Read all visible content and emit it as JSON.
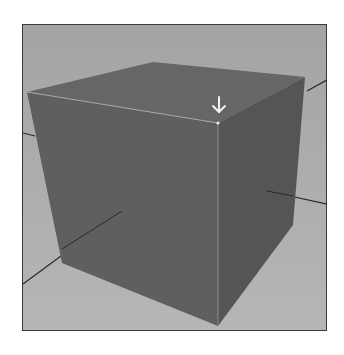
{
  "figure": {
    "colors": {
      "background": "#a6a6a6",
      "floor_light": "#b2b2b2",
      "cube_top": "#666666",
      "cube_front": "#5f5f5f",
      "cube_right": "#555555",
      "grid_line": "#2a2a2a",
      "highlight_edge": "#c8c8c8",
      "arrow": "#f2f2f2",
      "frame_border": "#3a3a3a"
    },
    "icons": [
      "down-arrow-icon"
    ]
  }
}
